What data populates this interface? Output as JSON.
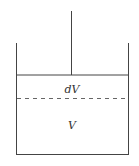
{
  "diagram": {
    "type": "piston-cylinder",
    "labels": {
      "upper_region": "dV",
      "lower_region": "V"
    },
    "colors": {
      "stroke": "#444444",
      "dashed": "#666666",
      "background": "#ffffff"
    }
  }
}
